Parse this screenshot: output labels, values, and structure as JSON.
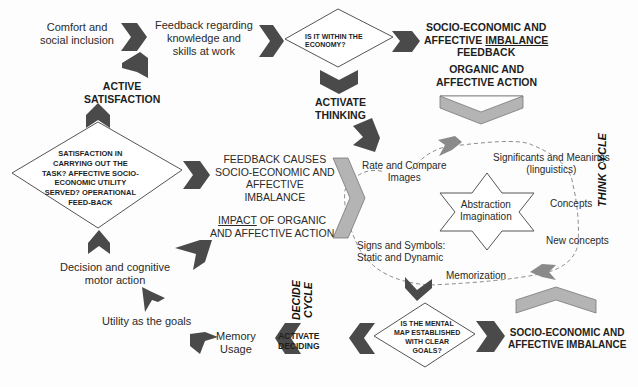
{
  "colors": {
    "dark_chevron": "#4a4a4a",
    "light_chevron": "#b4b4b4",
    "mid_chevron": "#8a8a8a",
    "outline": "#555555",
    "background": "#fdfdfd"
  },
  "nodes": {
    "comfort": {
      "line1": "Comfort and",
      "line2": "social inclusion"
    },
    "feedback_knowledge": {
      "line1": "Feedback regarding",
      "line2": "knowledge  and",
      "line3": "skills  at work"
    },
    "economy_decision": {
      "line1": "IS IT WITHIN THE",
      "line2": "ECONOMY?"
    },
    "imbalance_feedback": {
      "line1": "SOCIO-ECONOMIC AND",
      "line2a": "AFFECTIVE ",
      "line2b": "IMBALANCE",
      "line3": "FEEDBACK"
    },
    "organic_action": {
      "line1": "ORGANIC AND",
      "line2": "AFFECTIVE ACTION"
    },
    "active_satisfaction": {
      "line1": "ACTIVE",
      "line2": "SATISFACTION"
    },
    "activate_thinking": {
      "line1": "ACTIVATE",
      "line2": "THINKING"
    },
    "satisfaction_decision": {
      "line1": "SATISFACTION IN",
      "line2": "CARRYING OUT THE",
      "line3": "TASK? AFFECTIVE SOCIO-",
      "line4": "ECONOMIC UTILITY",
      "line5": "SERVED? OPERATIONAL",
      "line6": "FEED-BACK"
    },
    "feedback_causes": {
      "line1": "FEEDBACK CAUSES",
      "line2": "SOCIO-ECONOMIC AND",
      "line3": "AFFECTIVE",
      "line4": "IMBALANCE"
    },
    "impact": {
      "line1a": "IMPACT",
      "line1b": " OF ORGANIC",
      "line2": "AND AFFECTIVE ACTION"
    },
    "rate_compare": {
      "line1": "Rate and Compare",
      "line2": "Images"
    },
    "significants": {
      "line1": "Significants and Meanings",
      "line2": "(linguistics)"
    },
    "abstraction": {
      "line1": "Abstraction",
      "line2": "Imagination"
    },
    "concepts": {
      "line1": "Concepts"
    },
    "new_concepts": {
      "line1": "New concepts"
    },
    "signs_symbols": {
      "line1": "Signs and Symbols:",
      "line2": "Static and Dynamic"
    },
    "memorization": {
      "line1": "Memorization"
    },
    "think_cycle": {
      "label": "THINK CYCLE"
    },
    "decide_cycle": {
      "line1": "DECIDE",
      "line2": "CYCLE"
    },
    "decision_motor": {
      "line1": "Decision and cognitive",
      "line2": "motor action"
    },
    "utility_goals": {
      "line1": "Utility as the goals"
    },
    "memory_usage": {
      "line1": "Memory",
      "line2": "Usage"
    },
    "activate_deciding": {
      "line1": "ACTIVATE",
      "line2": "DECIDING"
    },
    "mental_map_decision": {
      "line1": "IS THE MENTAL",
      "line2": "MAP ESTABLISHED",
      "line3": "WITH CLEAR",
      "line4": "GOALS?"
    },
    "imbalance_bottom": {
      "line1": "SOCIO-ECONOMIC  AND",
      "line2": "AFFECTIVE IMBALANCE"
    }
  }
}
